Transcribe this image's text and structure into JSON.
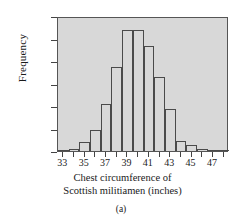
{
  "chart_data": {
    "type": "bar",
    "title": "",
    "subtitle": "",
    "panel_label": "(a)",
    "xlabel_line1": "Chest circumference of",
    "xlabel_line2": "Scottish militiamen (inches)",
    "ylabel": "Frequency",
    "categories": [
      33,
      34,
      35,
      36,
      37,
      38,
      39,
      40,
      41,
      42,
      43,
      44,
      45,
      46,
      47,
      48
    ],
    "bin_edges": [
      32.5,
      33.5,
      34.5,
      35.5,
      36.5,
      37.5,
      38.5,
      39.5,
      40.5,
      41.5,
      42.5,
      43.5,
      44.5,
      45.5,
      46.5,
      47.5,
      48.5
    ],
    "values": [
      3,
      18,
      81,
      185,
      420,
      749,
      1073,
      1079,
      934,
      658,
      370,
      92,
      50,
      21,
      4,
      1
    ],
    "xlim": [
      32.5,
      48.5
    ],
    "ylim": [
      0,
      1200
    ],
    "xticks": [
      33,
      34,
      35,
      36,
      37,
      38,
      39,
      40,
      41,
      42,
      43,
      44,
      45,
      46,
      47,
      48
    ],
    "xtick_labels": [
      "33",
      "",
      "35",
      "",
      "37",
      "",
      "39",
      "",
      "41",
      "",
      "43",
      "",
      "45",
      "",
      "47",
      ""
    ],
    "yticks": [
      0,
      200,
      400,
      600,
      800,
      1000,
      1200
    ],
    "ytick_labels": [
      "0",
      "200",
      "400",
      "600",
      "800",
      "1,000",
      "1,200"
    ],
    "grid": false,
    "legend": null,
    "bar_fill_color": "#d8d8d8",
    "bar_edge_color": "#4a4a4a",
    "plot_background_color": "#d8d8d8",
    "axis_color": "#555555"
  }
}
